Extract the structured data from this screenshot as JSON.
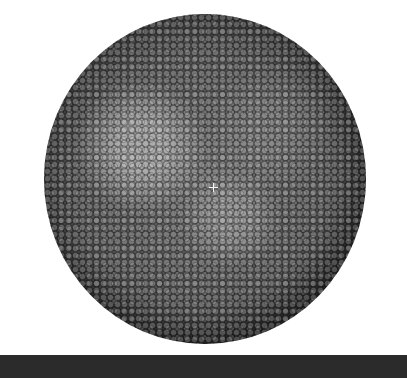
{
  "scene": {
    "subject": "molecular-sphere-spacefill-render",
    "background_color": "#ffffff",
    "bead_color_dark": "#2a2a2a",
    "bead_color_light": "#c8c8c8",
    "center_marker": "crosshair-icon"
  },
  "bottom_bar": {
    "color": "#2b2b2b"
  }
}
